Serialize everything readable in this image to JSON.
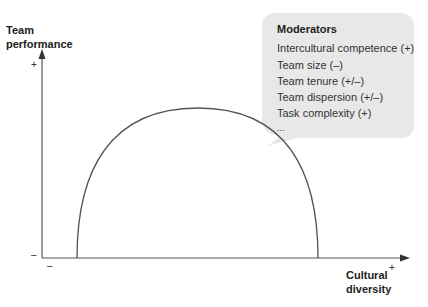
{
  "diagram": {
    "y_axis_label_line1": "Team",
    "y_axis_label_line2": "performance",
    "x_axis_label_line1": "Cultural",
    "x_axis_label_line2": "diversity",
    "y_plus": "+",
    "y_minus": "–",
    "x_plus": "+",
    "x_minus": "–",
    "curve_shape": "inverted-U",
    "moderators": {
      "title": "Moderators",
      "items": [
        "Intercultural competence (+)",
        "Team size (–)",
        "Team tenure (+/–)",
        "Team dispersion (+/–)",
        "Task complexity (+)",
        "..."
      ]
    },
    "colors": {
      "axis": "#555555",
      "curve": "#555555",
      "bubble": "#e8e8e8"
    }
  }
}
